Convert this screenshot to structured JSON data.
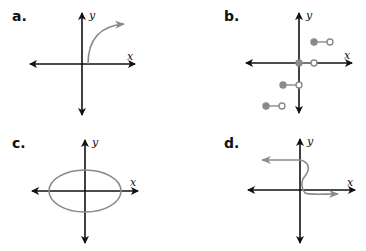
{
  "colors": {
    "axis": "#111111",
    "curve": "#8a8a8a",
    "background": "#ffffff"
  },
  "panels": [
    {
      "label": "a.",
      "x_axis_label": "x",
      "y_axis_label": "y",
      "description": "curve starting at positive x-axis, rising up and turning right with arrow"
    },
    {
      "label": "b.",
      "x_axis_label": "x",
      "y_axis_label": "y",
      "description": "step function (greatest integer) with filled left endpoints and open right endpoints"
    },
    {
      "label": "c.",
      "x_axis_label": "x",
      "y_axis_label": "y",
      "description": "horizontal ellipse centered at origin"
    },
    {
      "label": "d.",
      "x_axis_label": "x",
      "y_axis_label": "y",
      "description": "relation with leftward arrow above, S-shaped curve along y-axis, rightward arrow below x-axis"
    }
  ]
}
